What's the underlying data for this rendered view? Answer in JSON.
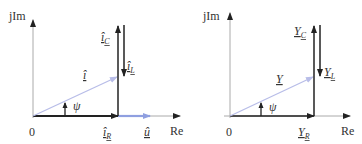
{
  "colors": {
    "axis": "#aaaaaa",
    "dark": "#222222",
    "blue": "#8f9fe0",
    "lightblue": "#b8bde8",
    "text": "#333333"
  },
  "left": {
    "axis_y_label": "jIm",
    "axis_x_label": "Re",
    "origin_label": "0",
    "angle_label": "ψ",
    "phasors": {
      "total": {
        "label": "î",
        "description": "total current"
      },
      "capacitive": {
        "label": "îC",
        "main": "î",
        "sub": "C"
      },
      "inductive": {
        "label": "îL",
        "main": "î",
        "sub": "L"
      },
      "resistive": {
        "label": "îR",
        "main": "î",
        "sub": "R"
      },
      "voltage": {
        "label": "û",
        "main": "û"
      }
    }
  },
  "right": {
    "axis_y_label": "jIm",
    "axis_x_label": "Re",
    "origin_label": "0",
    "angle_label": "ψ",
    "phasors": {
      "total": {
        "label": "Y",
        "main": "Y"
      },
      "capacitive": {
        "label": "YC",
        "main": "Y",
        "sub": "C"
      },
      "inductive": {
        "label": "YL",
        "main": "Y",
        "sub": "L"
      },
      "resistive": {
        "label": "YR",
        "main": "Y",
        "sub": "R"
      }
    }
  }
}
